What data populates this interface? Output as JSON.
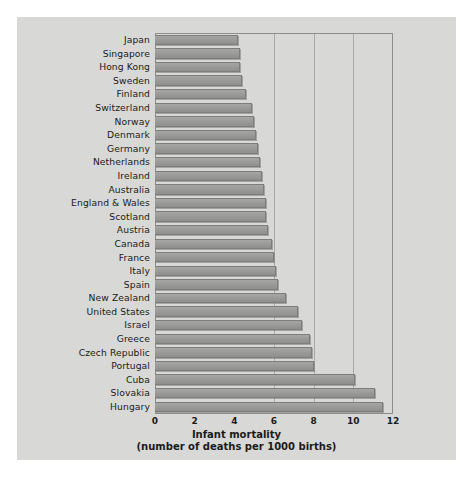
{
  "chart_data": {
    "type": "bar",
    "orientation": "horizontal",
    "title": "Infant mortality",
    "subtitle": "(number of deaths per 1000 births)",
    "xlabel": "Infant mortality (number of deaths per 1000 births)",
    "ylabel": "",
    "xlim": [
      0,
      12
    ],
    "xticks": [
      0,
      2,
      4,
      6,
      8,
      10,
      12
    ],
    "xtick_labels": [
      "0",
      "2",
      "4",
      "6",
      "8",
      "10",
      "12"
    ],
    "grid": "vertical gridlines at 6, 8, 10",
    "gridlines": [
      6,
      8,
      10
    ],
    "legend": null,
    "bar_color": "#9b9b99",
    "bar_edge_color": "#7d7d7b",
    "panel_color": "#d8d8d6",
    "categories": [
      "Japan",
      "Singapore",
      "Hong Kong",
      "Sweden",
      "Finland",
      "Switzerland",
      "Norway",
      "Denmark",
      "Germany",
      "Netherlands",
      "Ireland",
      "Australia",
      "England & Wales",
      "Scotland",
      "Austria",
      "Canada",
      "France",
      "Italy",
      "Spain",
      "New Zealand",
      "United States",
      "Israel",
      "Greece",
      "Czech Republic",
      "Portugal",
      "Cuba",
      "Slovakia",
      "Hungary"
    ],
    "values": [
      4.2,
      4.3,
      4.3,
      4.4,
      4.6,
      4.9,
      5.0,
      5.1,
      5.2,
      5.3,
      5.4,
      5.5,
      5.6,
      5.6,
      5.7,
      5.9,
      6.0,
      6.1,
      6.2,
      6.6,
      7.2,
      7.4,
      7.8,
      7.9,
      8.0,
      10.1,
      11.1,
      11.5
    ]
  },
  "axis": {
    "title": "Infant mortality",
    "subtitle": "(number of deaths per 1000 births)"
  }
}
